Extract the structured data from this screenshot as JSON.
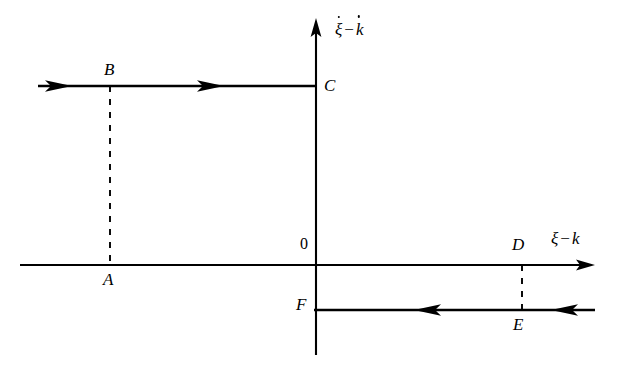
{
  "figure": {
    "type": "phase-plane-diagram",
    "background_color": "#ffffff",
    "stroke_color": "#000000",
    "axes": {
      "y_axis": {
        "label_parts": {
          "first": "ξ",
          "operator": "−",
          "second": "k"
        },
        "label_text": "ξ̇ − k̇",
        "direction": "up",
        "x": 316,
        "top": 18,
        "bottom": 355
      },
      "x_axis": {
        "label_parts": {
          "first": "ξ",
          "operator": "−",
          "second": "k"
        },
        "label_text": "ξ − k",
        "direction": "right",
        "y": 265,
        "left": 20,
        "right": 595
      },
      "origin_label": "0"
    },
    "points": [
      {
        "id": "A",
        "label": "A",
        "x": 110,
        "y": 265,
        "label_x": 103,
        "label_y": 272,
        "position": "below-axis"
      },
      {
        "id": "B",
        "label": "B",
        "x": 110,
        "y": 86,
        "label_x": 104,
        "label_y": 62,
        "position": "above-line"
      },
      {
        "id": "C",
        "label": "C",
        "x": 316,
        "y": 86,
        "label_x": 325,
        "label_y": 78,
        "position": "right-of-axis"
      },
      {
        "id": "D",
        "label": "D",
        "x": 522,
        "y": 265,
        "label_x": 513,
        "label_y": 238,
        "position": "above-axis"
      },
      {
        "id": "E",
        "label": "E",
        "x": 522,
        "y": 310,
        "label_x": 514,
        "label_y": 317,
        "position": "below-line"
      },
      {
        "id": "F",
        "label": "F",
        "x": 316,
        "y": 310,
        "label_x": 297,
        "label_y": 297,
        "position": "left-of-axis"
      }
    ],
    "branches": [
      {
        "name": "upper-branch",
        "from": "incoming-left",
        "to": "C",
        "y": 86,
        "x_start": 38,
        "x_end": 316,
        "direction": "rightward",
        "arrow_positions": [
          60,
          214
        ],
        "passes_through": [
          "B"
        ]
      },
      {
        "name": "lower-branch",
        "from": "incoming-right",
        "to": "F",
        "y": 310,
        "x_start": 316,
        "x_end": 595,
        "direction": "leftward",
        "arrow_positions": [
          436,
          572
        ],
        "passes_through": [
          "E"
        ]
      }
    ],
    "connectors": [
      {
        "name": "A-to-B",
        "style": "dashed",
        "x": 110,
        "y_top": 86,
        "y_bottom": 265
      },
      {
        "name": "D-to-E",
        "style": "dashed",
        "x": 522,
        "y_top": 265,
        "y_bottom": 310
      }
    ]
  }
}
